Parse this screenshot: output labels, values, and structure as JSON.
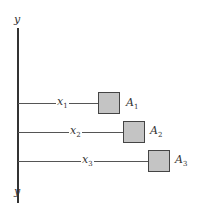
{
  "axis": {
    "top_label": "y",
    "bottom_label": "y"
  },
  "arms": [
    {
      "x_label": "x",
      "x_sub": "1",
      "area_label": "A",
      "area_sub": "1"
    },
    {
      "x_label": "x",
      "x_sub": "2",
      "area_label": "A",
      "area_sub": "2"
    },
    {
      "x_label": "x",
      "x_sub": "3",
      "area_label": "A",
      "area_sub": "3"
    }
  ],
  "colors": {
    "square_fill": "#c4c4c4",
    "line": "#444444"
  }
}
